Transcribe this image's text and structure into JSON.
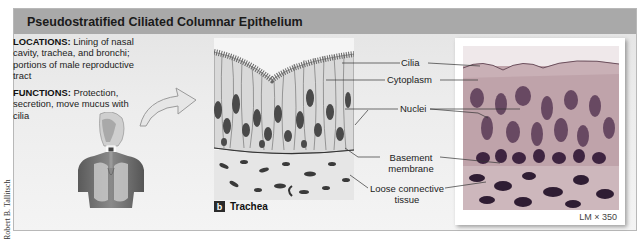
{
  "credit": "Robert B. Tallitsch",
  "header": {
    "title": "Pseudostratified Ciliated Columnar Epithelium"
  },
  "info": {
    "locations_label": "LOCATIONS:",
    "locations_text": "Lining of nasal cavity, trachea, and bronchi; portions of male reproductive tract",
    "functions_label": "FUNCTIONS:",
    "functions_text": "Protection, secretion, move mucus with cilia"
  },
  "figure": {
    "panel_letter": "b",
    "panel_title": "Trachea"
  },
  "labels": {
    "cilia": "Cilia",
    "cytoplasm": "Cytoplasm",
    "nuclei": "Nuclei",
    "basement_line1": "Basement",
    "basement_line2": "membrane",
    "loose_line1": "Loose connective",
    "loose_line2": "tissue"
  },
  "micrograph": {
    "magnification": "LM × 350"
  },
  "colors": {
    "header_bg": "#a9a9a9",
    "panel_bg": "#ececec",
    "cell_fill": "#d8d8d8",
    "nucleus": "#4a4a4a",
    "stain_pink": "#b79aa2",
    "stain_purple": "#4b2f4a"
  }
}
